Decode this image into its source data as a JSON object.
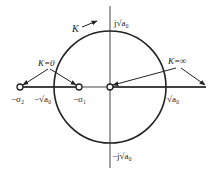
{
  "diagram": {
    "type": "root-locus",
    "colors": {
      "stroke": "#222222",
      "background": "#ffffff"
    },
    "labels": {
      "k_direction": "K",
      "k_zero": "K=0",
      "k_infinity": "K=∞",
      "imag_pos": "j√a₀",
      "imag_neg": "−j√a₀",
      "neg_sigma2": "−σ₂",
      "neg_sqrt_a0": "−√a₀",
      "neg_sigma1": "−σ₁",
      "pos_sqrt_a0": "√a₀"
    },
    "poles": [
      {
        "name": "-sigma2",
        "x": 20
      },
      {
        "name": "-sigma1",
        "x": 79
      },
      {
        "name": "origin",
        "x": 110
      }
    ],
    "circle": {
      "cx": 110,
      "cy": 87,
      "r": 56
    }
  }
}
